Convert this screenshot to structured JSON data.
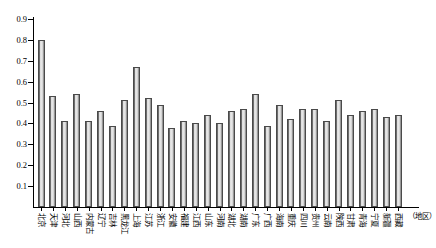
{
  "chart_data": {
    "type": "bar",
    "title": "",
    "subtitle": "",
    "xlabel": "（地区）",
    "ylabel": "",
    "ylim": [
      0,
      0.9
    ],
    "ytick_step": 0.1,
    "ytick_labels": [
      "0",
      "0.1",
      "0.2",
      "0.3",
      "0.4",
      "0.5",
      "0.6",
      "0.7",
      "0.8",
      "0.9"
    ],
    "grid": false,
    "legend": null,
    "legend_position": "none",
    "bar_color": "#d9d9d9",
    "bar_edge_color": "#4a4a4a",
    "axis_color": "#000000",
    "categories": [
      "北京",
      "天津",
      "河北",
      "山西",
      "内蒙古",
      "辽宁",
      "吉林",
      "黑龙江",
      "上海",
      "江苏",
      "浙江",
      "安徽",
      "福建",
      "江西",
      "山东",
      "河南",
      "湖北",
      "湖南",
      "广东",
      "广西",
      "海南",
      "重庆",
      "四川",
      "贵州",
      "云南",
      "陕西",
      "甘肃",
      "青海",
      "宁夏",
      "新疆",
      "西藏"
    ],
    "values": [
      0.8,
      0.53,
      0.41,
      0.54,
      0.41,
      0.46,
      0.39,
      0.51,
      0.67,
      0.52,
      0.49,
      0.38,
      0.41,
      0.4,
      0.44,
      0.4,
      0.46,
      0.47,
      0.54,
      0.39,
      0.49,
      0.42,
      0.47,
      0.47,
      0.41,
      0.51,
      0.44,
      0.46,
      0.47,
      0.43,
      0.44
    ]
  }
}
